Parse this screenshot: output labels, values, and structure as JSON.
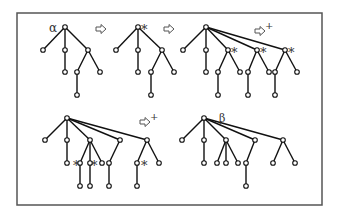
{
  "frame": {
    "x": 17,
    "y": 13,
    "w": 305,
    "h": 192,
    "stroke": "#555555"
  },
  "style": {
    "edge_color": "#111111",
    "node_fill": "#ffffff",
    "node_stroke": "#111111",
    "node_r": 2.3
  },
  "labels": [
    {
      "id": "alpha-label",
      "text": "α",
      "x": 49,
      "y": 32,
      "size": 12
    },
    {
      "id": "beta-label",
      "text": "β",
      "x": 219,
      "y": 122,
      "size": 11
    },
    {
      "id": "star-t2-root",
      "text": "*",
      "x": 141,
      "y": 34,
      "size": 13
    },
    {
      "id": "star-t3-a",
      "text": "*",
      "x": 231,
      "y": 57,
      "size": 13
    },
    {
      "id": "star-t3-b",
      "text": "*",
      "x": 260,
      "y": 57,
      "size": 13
    },
    {
      "id": "star-t3-c",
      "text": "*",
      "x": 288,
      "y": 57,
      "size": 13
    },
    {
      "id": "star-t4-a",
      "text": "*",
      "x": 73,
      "y": 170,
      "size": 13
    },
    {
      "id": "star-t4-b",
      "text": "*",
      "x": 91,
      "y": 170,
      "size": 13
    },
    {
      "id": "star-t4-c",
      "text": "*",
      "x": 141,
      "y": 170,
      "size": 13
    }
  ],
  "arrows": [
    {
      "id": "arrow-1",
      "x": 96,
      "y": 29,
      "plus": false
    },
    {
      "id": "arrow-2",
      "x": 164,
      "y": 29,
      "plus": false
    },
    {
      "id": "arrow-3",
      "x": 255,
      "y": 31,
      "plus": true
    },
    {
      "id": "arrow-4",
      "x": 140,
      "y": 122,
      "plus": true
    }
  ],
  "trees": [
    {
      "name": "tree-alpha",
      "nodes": [
        [
          65,
          27
        ],
        [
          43,
          50
        ],
        [
          65,
          50
        ],
        [
          88,
          50
        ],
        [
          65,
          72
        ],
        [
          77,
          72
        ],
        [
          100,
          72
        ],
        [
          77,
          95
        ]
      ],
      "edges": [
        [
          0,
          1
        ],
        [
          0,
          2
        ],
        [
          0,
          3
        ],
        [
          2,
          4
        ],
        [
          3,
          5
        ],
        [
          3,
          6
        ],
        [
          5,
          7
        ]
      ]
    },
    {
      "name": "tree-step-2",
      "nodes": [
        [
          138,
          27
        ],
        [
          116,
          50
        ],
        [
          138,
          50
        ],
        [
          162,
          50
        ],
        [
          138,
          72
        ],
        [
          151,
          72
        ],
        [
          174,
          72
        ],
        [
          151,
          95
        ]
      ],
      "edges": [
        [
          0,
          1
        ],
        [
          0,
          2
        ],
        [
          0,
          3
        ],
        [
          2,
          4
        ],
        [
          3,
          5
        ],
        [
          3,
          6
        ],
        [
          5,
          7
        ]
      ]
    },
    {
      "name": "tree-step-3",
      "nodes": [
        [
          206,
          27
        ],
        [
          183,
          50
        ],
        [
          206,
          50
        ],
        [
          228,
          50
        ],
        [
          257,
          50
        ],
        [
          285,
          50
        ],
        [
          206,
          72
        ],
        [
          218,
          72
        ],
        [
          240,
          72
        ],
        [
          248,
          72
        ],
        [
          269,
          72
        ],
        [
          275,
          72
        ],
        [
          297,
          72
        ],
        [
          218,
          95
        ],
        [
          248,
          95
        ],
        [
          275,
          95
        ]
      ],
      "edges": [
        [
          0,
          1
        ],
        [
          0,
          2
        ],
        [
          0,
          3
        ],
        [
          0,
          4
        ],
        [
          0,
          5
        ],
        [
          2,
          6
        ],
        [
          3,
          7
        ],
        [
          3,
          8
        ],
        [
          4,
          9
        ],
        [
          4,
          10
        ],
        [
          5,
          11
        ],
        [
          5,
          12
        ],
        [
          7,
          13
        ],
        [
          9,
          14
        ],
        [
          11,
          15
        ]
      ]
    },
    {
      "name": "tree-step-4",
      "nodes": [
        [
          67,
          118
        ],
        [
          45,
          140
        ],
        [
          67,
          140
        ],
        [
          90,
          140
        ],
        [
          120,
          140
        ],
        [
          147,
          140
        ],
        [
          67,
          163
        ],
        [
          80,
          163
        ],
        [
          90,
          163
        ],
        [
          102,
          163
        ],
        [
          109,
          163
        ],
        [
          137,
          163
        ],
        [
          159,
          163
        ],
        [
          80,
          186
        ],
        [
          90,
          186
        ],
        [
          109,
          186
        ],
        [
          137,
          186
        ]
      ],
      "edges": [
        [
          0,
          1
        ],
        [
          0,
          2
        ],
        [
          0,
          3
        ],
        [
          0,
          4
        ],
        [
          0,
          5
        ],
        [
          2,
          6
        ],
        [
          3,
          7
        ],
        [
          3,
          8
        ],
        [
          3,
          9
        ],
        [
          4,
          10
        ],
        [
          5,
          11
        ],
        [
          5,
          12
        ],
        [
          7,
          13
        ],
        [
          8,
          14
        ],
        [
          10,
          15
        ],
        [
          11,
          16
        ]
      ]
    },
    {
      "name": "tree-beta",
      "nodes": [
        [
          204,
          118
        ],
        [
          182,
          140
        ],
        [
          204,
          140
        ],
        [
          226,
          140
        ],
        [
          255,
          140
        ],
        [
          283,
          140
        ],
        [
          204,
          163
        ],
        [
          217,
          163
        ],
        [
          226,
          163
        ],
        [
          238,
          163
        ],
        [
          246,
          163
        ],
        [
          273,
          163
        ],
        [
          295,
          163
        ],
        [
          246,
          186
        ]
      ],
      "edges": [
        [
          0,
          1
        ],
        [
          0,
          2
        ],
        [
          0,
          3
        ],
        [
          0,
          4
        ],
        [
          0,
          5
        ],
        [
          2,
          6
        ],
        [
          3,
          7
        ],
        [
          3,
          8
        ],
        [
          3,
          9
        ],
        [
          4,
          10
        ],
        [
          5,
          11
        ],
        [
          5,
          12
        ],
        [
          10,
          13
        ]
      ]
    }
  ]
}
